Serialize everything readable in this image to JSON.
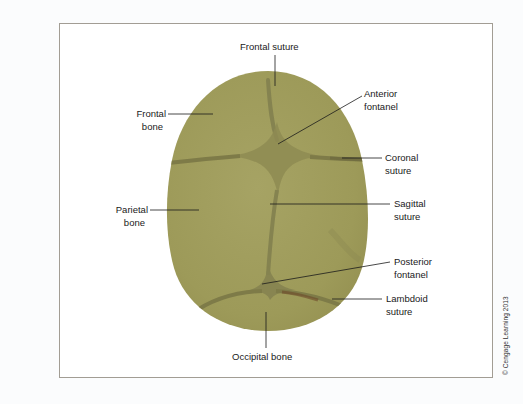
{
  "diagram": {
    "colors": {
      "background": "#fbfcfd",
      "frame_border": "#a29d94",
      "bone_fill": "#9e9b5a",
      "bone_fill_light": "#a7a466",
      "suture": "#7a7846",
      "lambdoid_accent": "#6e4a2a",
      "leader_line": "#1a1a1a"
    },
    "labels": {
      "frontal_suture": "Frontal suture",
      "frontal_bone_line1": "Frontal",
      "frontal_bone_line2": "bone",
      "anterior_fontanel_line1": "Anterior",
      "anterior_fontanel_line2": "fontanel",
      "coronal_suture_line1": "Coronal",
      "coronal_suture_line2": "suture",
      "parietal_bone_line1": "Parietal",
      "parietal_bone_line2": "bone",
      "sagittal_suture_line1": "Sagittal",
      "sagittal_suture_line2": "suture",
      "posterior_fontanel_line1": "Posterior",
      "posterior_fontanel_line2": "fontanel",
      "lambdoid_suture_line1": "Lambdoid",
      "lambdoid_suture_line2": "suture",
      "occipital_bone": "Occipital bone"
    },
    "credit": "© Cengage Learning 2013"
  }
}
